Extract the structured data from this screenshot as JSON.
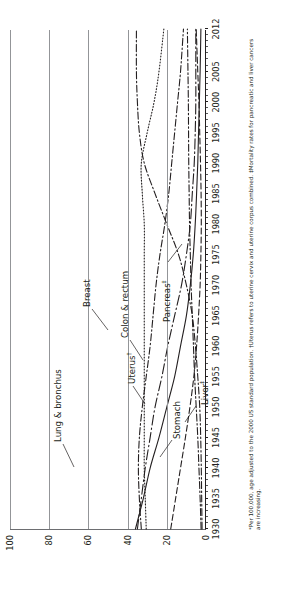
{
  "chart_data": {
    "type": "line",
    "title": "",
    "xlabel": "",
    "ylabel": "Rate per 100,000 female population",
    "xlim": [
      1930,
      2012
    ],
    "ylim": [
      0,
      100
    ],
    "yticks": [
      0,
      20,
      40,
      60,
      80,
      100
    ],
    "xticks": [
      1930,
      1935,
      1940,
      1945,
      1950,
      1955,
      1960,
      1965,
      1970,
      1975,
      1980,
      1985,
      1990,
      1995,
      2000,
      2005,
      2012
    ],
    "grid": "horizontal",
    "legend_position": "inline-annotations",
    "footnote": "*Per 100,000, age adjusted to the 2000 US standard population. †Uterus refers to uterine cervix and uterine corpus combined. ‡Mortality rates for pancreatic and liver cancers are increasing.",
    "series": [
      {
        "name": "Lung & bronchus",
        "label": "Lung & bronchus",
        "style": "dash-dot",
        "x": [
          1930,
          1935,
          1940,
          1945,
          1950,
          1955,
          1960,
          1965,
          1970,
          1975,
          1980,
          1985,
          1990,
          1995,
          2000,
          2005,
          2012
        ],
        "values": [
          2.0,
          2.2,
          2.4,
          2.7,
          3.2,
          4.2,
          5.4,
          7.0,
          10.0,
          14.0,
          20.0,
          26.0,
          31.5,
          34.0,
          35.0,
          35.5,
          35.5
        ]
      },
      {
        "name": "Breast",
        "label": "Breast",
        "style": "dotted",
        "x": [
          1930,
          1935,
          1940,
          1945,
          1950,
          1955,
          1960,
          1965,
          1970,
          1975,
          1980,
          1985,
          1990,
          1995,
          2000,
          2005,
          2012
        ],
        "values": [
          30.5,
          31.0,
          31.5,
          31.5,
          31.5,
          31.5,
          31.5,
          31.5,
          31.5,
          31.5,
          31.5,
          32.5,
          33.0,
          30.0,
          26.5,
          24.0,
          21.5
        ]
      },
      {
        "name": "Colon & rectum",
        "label": "Colon & rectum",
        "style": "dash-dot",
        "x": [
          1930,
          1935,
          1940,
          1945,
          1950,
          1955,
          1960,
          1965,
          1970,
          1975,
          1980,
          1985,
          1990,
          1995,
          2000,
          2005,
          2012
        ],
        "values": [
          33.0,
          34.0,
          34.5,
          34.0,
          32.5,
          30.5,
          28.5,
          27.0,
          25.5,
          23.5,
          21.0,
          19.0,
          17.5,
          16.0,
          14.5,
          13.0,
          11.5
        ]
      },
      {
        "name": "Stomach",
        "label": "Stomach",
        "style": "solid",
        "x": [
          1930,
          1935,
          1940,
          1945,
          1950,
          1955,
          1960,
          1965,
          1970,
          1975,
          1980,
          1985,
          1990,
          1995,
          2000,
          2005,
          2012
        ],
        "values": [
          36.0,
          32.0,
          28.5,
          24.0,
          20.0,
          16.0,
          13.0,
          10.0,
          8.0,
          6.5,
          5.5,
          4.8,
          4.2,
          3.8,
          3.4,
          3.0,
          2.6
        ]
      },
      {
        "name": "Uterus",
        "label": "Uterus†",
        "style": "dash-dot-long",
        "x": [
          1930,
          1935,
          1940,
          1945,
          1950,
          1955,
          1960,
          1965,
          1970,
          1975,
          1980,
          1985,
          1990,
          1995,
          2000,
          2005,
          2012
        ],
        "values": [
          35.0,
          33.0,
          31.0,
          28.5,
          26.0,
          22.5,
          19.5,
          16.0,
          12.5,
          10.0,
          8.0,
          7.0,
          6.0,
          5.5,
          5.2,
          5.2,
          5.2
        ]
      },
      {
        "name": "Pancreas",
        "label": "Pancreas‡",
        "style": "dash-dot",
        "x": [
          1930,
          1935,
          1940,
          1945,
          1950,
          1955,
          1960,
          1965,
          1970,
          1975,
          1980,
          1985,
          1990,
          1995,
          2000,
          2005,
          2012
        ],
        "values": [
          2.5,
          3.0,
          3.6,
          4.2,
          5.0,
          5.8,
          6.4,
          7.0,
          7.6,
          8.0,
          8.4,
          8.6,
          8.8,
          8.9,
          9.0,
          9.2,
          9.5
        ]
      },
      {
        "name": "Liver",
        "label": "Liver‡",
        "style": "dashed",
        "x": [
          1930,
          1935,
          1940,
          1945,
          1950,
          1955,
          1960,
          1965,
          1970,
          1975,
          1980,
          1985,
          1990,
          1995,
          2000,
          2005,
          2012
        ],
        "values": [
          18.0,
          15.5,
          13.0,
          10.5,
          8.2,
          6.2,
          4.8,
          3.8,
          3.0,
          2.6,
          2.4,
          2.5,
          2.8,
          3.2,
          3.6,
          4.2,
          5.0
        ]
      }
    ]
  },
  "axis": {
    "ylabel": "Rate per 100,000 female population",
    "yticks": [
      "100",
      "80",
      "60",
      "40",
      "20",
      "0"
    ],
    "xticks": [
      "1930",
      "1935",
      "1940",
      "1945",
      "1950",
      "1955",
      "1960",
      "1965",
      "1970",
      "1975",
      "1980",
      "1985",
      "1990",
      "1995",
      "2000",
      "2005",
      "2012"
    ]
  },
  "annotations": {
    "lung": "Lung & bronchus",
    "breast": "Breast",
    "colorectum": "Colon & rectum",
    "stomach": "Stomach",
    "uterus": "Uterus",
    "uterus_mark": "†",
    "pancreas": "Pancreas",
    "pancreas_mark": "‡",
    "liver": "Liver",
    "liver_mark": "‡"
  },
  "footnote": {
    "text": "*Per 100,000, age adjusted to the 2000 US standard population. †Uterus refers to uterine cervix and uterine corpus combined. ‡Mortality rates for pancreatic and liver cancers are increasing."
  }
}
